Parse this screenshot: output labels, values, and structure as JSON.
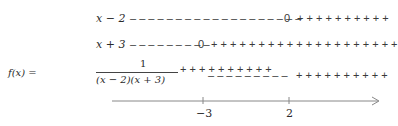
{
  "rows": [
    {
      "label": "x − 2",
      "left_signs": "– – – – – – – – – – – – – – – – – – –",
      "zero": "0",
      "right_signs": "+ + + + + + + + + +"
    },
    {
      "label": "x + 3",
      "left_signs": "– – – – – – – – –",
      "zero": "0",
      "right_signs": "+ + + + + + + + + + + + + + + + + + + +"
    },
    {
      "func_prefix": "f(x) =",
      "numerator": "1",
      "denominator": "(x − 2)(x + 3)",
      "seg1_signs": "+ + + + + + + + + +",
      "seg2_signs": "– – – – – – – – –",
      "seg3_signs": "+ + + + + + + + + +"
    }
  ],
  "axis": {
    "ticks": [
      {
        "label": "−3",
        "value": -3
      },
      {
        "label": "2",
        "value": 2
      }
    ],
    "color": "#888888"
  }
}
